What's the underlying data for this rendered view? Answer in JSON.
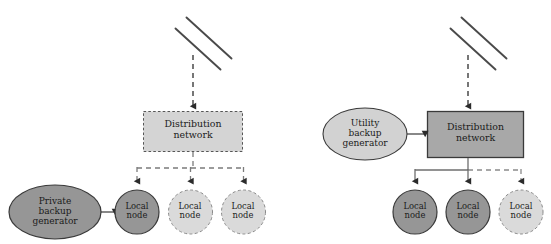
{
  "diagram": {
    "type": "network-topology",
    "title": "",
    "panel_count": 2,
    "colors": {
      "dark_fill": "#969696",
      "light_fill": "#d4d4d4",
      "mid_fill": "#b0b0b0",
      "stroke_dark": "#3a3a3a",
      "stroke_light": "#8a8a8a",
      "text": "#1a1a1a",
      "background": "#ffffff"
    },
    "panels": [
      {
        "id": "left",
        "name": "private-backup-scenario",
        "transmission_line": {
          "label": "",
          "style": "solid",
          "segments": 2
        },
        "feed_arrow": {
          "style": "dashed",
          "direction": "down"
        },
        "distribution": {
          "label_line1": "Distribution",
          "label_line2": "network",
          "border": "dashed",
          "fill": "light"
        },
        "branch_connector": {
          "style": "dashed",
          "solid_until": "none"
        },
        "generator": {
          "label_line1": "Private",
          "label_line2": "backup",
          "label_line3": "generator",
          "fill": "dark",
          "border": "solid",
          "arrow_style": "solid",
          "arrow_direction": "right"
        },
        "nodes": [
          {
            "label_line1": "Local",
            "label_line2": "node",
            "fill": "dark",
            "border": "solid",
            "arrow": "dashed"
          },
          {
            "label_line1": "Local",
            "label_line2": "node",
            "fill": "light",
            "border": "dashed",
            "arrow": "dashed"
          },
          {
            "label_line1": "Local",
            "label_line2": "node",
            "fill": "light",
            "border": "dashed",
            "arrow": "dashed"
          }
        ]
      },
      {
        "id": "right",
        "name": "utility-backup-scenario",
        "transmission_line": {
          "label": "",
          "style": "solid",
          "segments": 2
        },
        "feed_arrow": {
          "style": "dashed",
          "direction": "down"
        },
        "distribution": {
          "label_line1": "Distribution",
          "label_line2": "network",
          "border": "solid",
          "fill": "dark"
        },
        "branch_connector": {
          "style": "mixed",
          "solid_until": "center"
        },
        "generator": {
          "label_line1": "Utility",
          "label_line2": "backup",
          "label_line3": "generator",
          "fill": "light",
          "border": "solid",
          "arrow_style": "solid",
          "arrow_direction": "right"
        },
        "nodes": [
          {
            "label_line1": "Local",
            "label_line2": "node",
            "fill": "dark",
            "border": "solid",
            "arrow": "solid"
          },
          {
            "label_line1": "Local",
            "label_line2": "node",
            "fill": "dark",
            "border": "solid",
            "arrow": "solid"
          },
          {
            "label_line1": "Local",
            "label_line2": "node",
            "fill": "light",
            "border": "dashed",
            "arrow": "dashed"
          }
        ]
      }
    ]
  }
}
